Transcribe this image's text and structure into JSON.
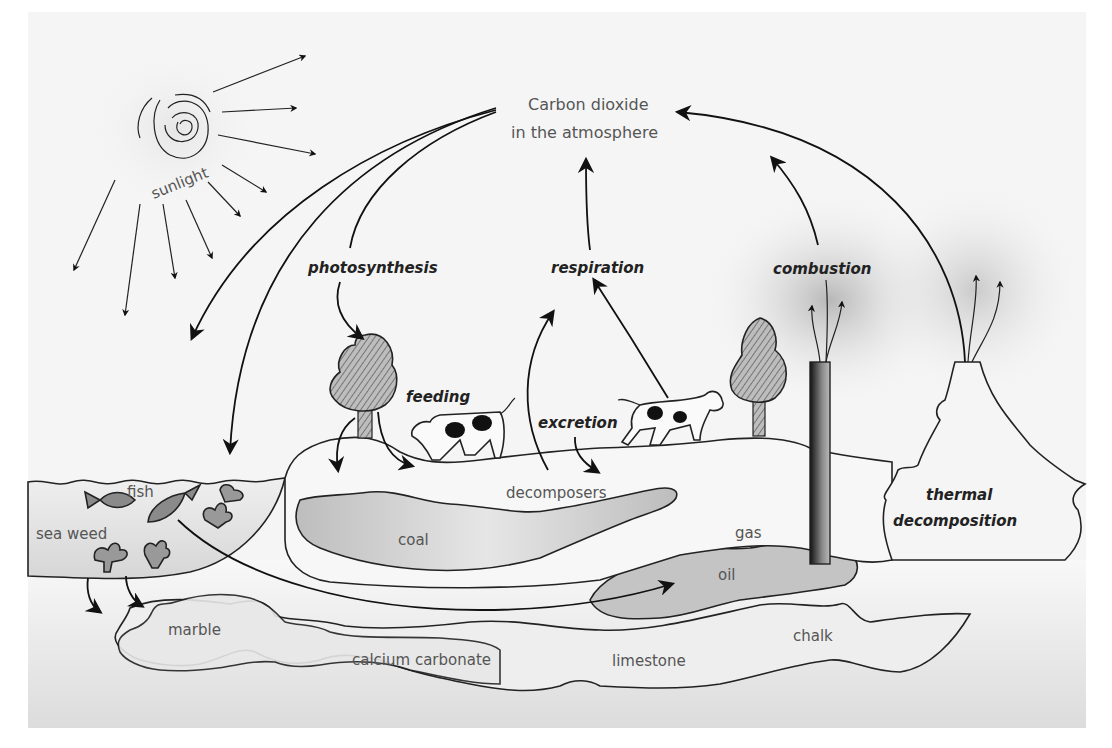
{
  "diagram": {
    "atmosphere": {
      "line1": "Carbon dioxide",
      "line2": "in the atmosphere"
    },
    "processes": {
      "photosynthesis": "photosynthesis",
      "respiration": "respiration",
      "combustion": "combustion",
      "feeding": "feeding",
      "excretion": "excretion",
      "thermal_line1": "thermal",
      "thermal_line2": "decomposition"
    },
    "labels": {
      "sunlight": "sunlight",
      "fish": "fish",
      "sea_weed": "sea weed",
      "decomposers": "decomposers",
      "coal": "coal",
      "gas": "gas",
      "oil": "oil",
      "marble": "marble",
      "calcium_carbonate": "calcium carbonate",
      "limestone": "limestone",
      "chalk": "chalk"
    },
    "colors": {
      "ink": "#111111",
      "label_grey": "#555555",
      "fill_grey": "#c8c8c8",
      "background": "#f4f4f4"
    }
  }
}
